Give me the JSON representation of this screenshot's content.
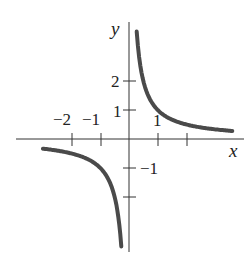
{
  "chart_data": {
    "type": "line",
    "title": "",
    "xlabel": "x",
    "ylabel": "y",
    "function": "y = 1/x",
    "xlim": [
      -3.4,
      3.8
    ],
    "ylim": [
      -3.8,
      4.0
    ],
    "grid": false,
    "x_ticks": [
      -2,
      -1,
      1,
      2
    ],
    "x_tick_labels": [
      "−2",
      "−1",
      "1",
      ""
    ],
    "y_ticks": [
      2,
      1,
      -1,
      -2
    ],
    "y_tick_labels": [
      "2",
      "1",
      "−1",
      ""
    ],
    "series": [
      {
        "name": "right branch",
        "x": [
          0.27,
          0.35,
          0.5,
          0.75,
          1.0,
          1.5,
          2.0,
          2.5,
          3.0,
          3.6
        ],
        "values": [
          3.7,
          2.86,
          2.0,
          1.33,
          1.0,
          0.67,
          0.5,
          0.4,
          0.33,
          0.28
        ]
      },
      {
        "name": "left branch",
        "x": [
          -3.0,
          -2.5,
          -2.0,
          -1.5,
          -1.0,
          -0.75,
          -0.5,
          -0.35,
          -0.27
        ],
        "values": [
          -0.33,
          -0.4,
          -0.5,
          -0.67,
          -1.0,
          -1.33,
          -2.0,
          -2.86,
          -3.7
        ]
      }
    ],
    "color": "#4a4a4a"
  },
  "labels": {
    "x_axis": "x",
    "y_axis": "y",
    "x_neg2": "−2",
    "x_neg1": "−1",
    "x_pos1": "1",
    "y_pos2": "2",
    "y_pos1": "1",
    "y_neg1": "−1"
  }
}
